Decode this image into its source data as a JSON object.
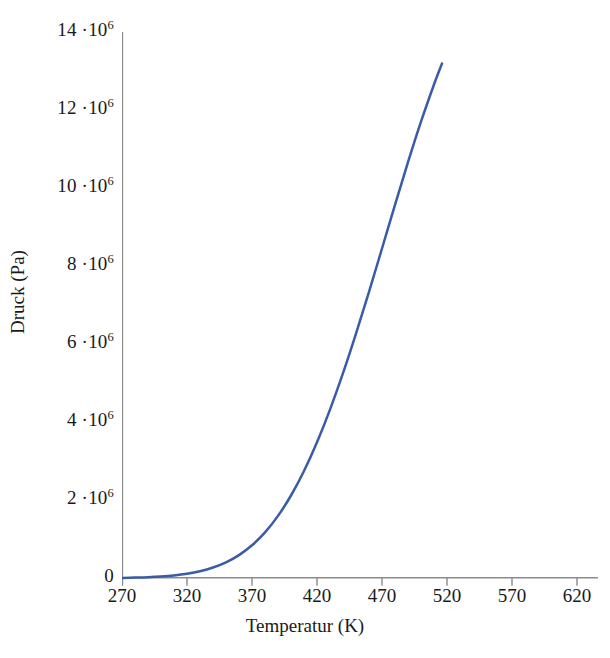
{
  "chart_data": {
    "type": "line",
    "title": "",
    "xlabel": "Temperatur (K)",
    "ylabel": "Druck (Pa)",
    "xlim": [
      270,
      636
    ],
    "ylim": [
      0,
      14000000
    ],
    "grid": false,
    "legend": "none",
    "line_color": "#3a5ba8",
    "axis_color": "#8c8c8c",
    "x_ticks": [
      270,
      320,
      370,
      420,
      470,
      520,
      570,
      620
    ],
    "x_tick_labels": [
      "270",
      "320",
      "370",
      "420",
      "470",
      "520",
      "570",
      "620"
    ],
    "y_ticks": [
      0,
      2000000,
      4000000,
      6000000,
      8000000,
      10000000,
      12000000,
      14000000
    ],
    "y_tick_labels": [
      "0",
      "2 ·10",
      "4 ·10",
      "6 ·10",
      "8 ·10",
      "10 ·10",
      "12 ·10",
      "14 ·10"
    ],
    "y_tick_exponent": "6",
    "series": [
      {
        "name": "Dampfdruckkurve",
        "x": [
          270,
          280,
          290,
          300,
          310,
          320,
          330,
          340,
          350,
          360,
          370,
          380,
          390,
          400,
          410,
          420,
          430,
          440,
          450,
          460,
          470,
          480,
          490,
          500,
          510,
          520,
          530,
          540,
          550,
          560,
          570,
          580,
          590,
          600,
          610,
          620,
          630,
          636
        ],
        "y": [
          3500,
          7000,
          13000,
          24000,
          42000,
          70000,
          114000,
          178000,
          270000,
          398000,
          572000,
          802000,
          1100000,
          1480000,
          1950000,
          2530000,
          3230000,
          4070000,
          5060000,
          6220000,
          2050000,
          2400000,
          2800000,
          3230000,
          3740000,
          4300000,
          4930000,
          5620000,
          6380000,
          7170000,
          8030000,
          8950000,
          9920000,
          10950000,
          12000000,
          12700000,
          13100000,
          13200000
        ]
      }
    ],
    "curve_points_px": [
      [
        0,
        545.9
      ],
      [
        13,
        545.6
      ],
      [
        26,
        545.2
      ],
      [
        39,
        544.5
      ],
      [
        52,
        543.4
      ],
      [
        65,
        541.7
      ],
      [
        78,
        539.2
      ],
      [
        91,
        535.5
      ],
      [
        104,
        530.3
      ],
      [
        117,
        523.1
      ],
      [
        130,
        513.3
      ],
      [
        143,
        500.4
      ],
      [
        156,
        483.9
      ],
      [
        169,
        463.5
      ],
      [
        182,
        439.0
      ],
      [
        195,
        410.3
      ],
      [
        208,
        377.6
      ],
      [
        221,
        341.2
      ],
      [
        234,
        301.7
      ],
      [
        247,
        259.8
      ],
      [
        260,
        216.5
      ],
      [
        273,
        172.9
      ],
      [
        286,
        130.2
      ],
      [
        299,
        89.7
      ],
      [
        312,
        52.5
      ],
      [
        320,
        31.5
      ]
    ],
    "annotations": []
  },
  "axes": {
    "x_title": "Temperatur (K)",
    "y_title": "Druck (Pa)"
  }
}
